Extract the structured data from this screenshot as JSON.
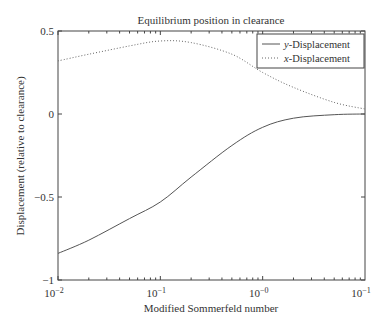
{
  "chart_data": {
    "type": "line",
    "title": "Equilibrium position in clearance",
    "xlabel": "Modified Sommerfeld number",
    "ylabel": "Displacement (relative to clearance)",
    "xscale": "log",
    "xlim": [
      0.01,
      10
    ],
    "ylim": [
      -1,
      0.5
    ],
    "x_tick_labels": [
      {
        "base": "10",
        "exp": "−2"
      },
      {
        "base": "10",
        "exp": "−1"
      },
      {
        "base": "10",
        "exp": "−0"
      },
      {
        "base": "10",
        "exp": "−1"
      }
    ],
    "y_ticks": [
      0.5,
      0,
      -0.5,
      -1
    ],
    "y_tick_labels": [
      "0.5",
      "0",
      "−0.5",
      "−1"
    ],
    "grid": false,
    "legend_position": "upper right",
    "series": [
      {
        "name": "y-Displacement",
        "name_italic": "y",
        "name_rest": "-Displacement",
        "style": "solid",
        "x": [
          0.01,
          0.02,
          0.05,
          0.1,
          0.2,
          0.5,
          1,
          2,
          5,
          10
        ],
        "values": [
          -0.84,
          -0.76,
          -0.63,
          -0.53,
          -0.38,
          -0.19,
          -0.08,
          -0.025,
          -0.004,
          0.0
        ]
      },
      {
        "name": "x-Displacement",
        "name_italic": "x",
        "name_rest": "-Displacement",
        "style": "dotted",
        "x": [
          0.01,
          0.02,
          0.05,
          0.1,
          0.2,
          0.5,
          1,
          2,
          5,
          10
        ],
        "values": [
          0.32,
          0.36,
          0.41,
          0.44,
          0.43,
          0.36,
          0.25,
          0.16,
          0.07,
          0.03
        ]
      }
    ]
  }
}
